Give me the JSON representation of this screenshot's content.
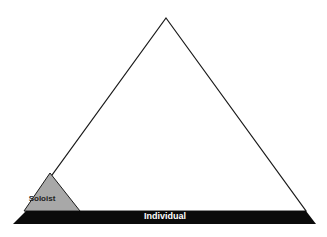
{
  "diagram": {
    "type": "pyramid",
    "base_label": "Individual",
    "corner_label": "Soloist",
    "colors": {
      "outline": "#1a1a1a",
      "base_band": "#0a0a0a",
      "soloist_fill": "#a8a8a8",
      "background": "#ffffff"
    }
  }
}
